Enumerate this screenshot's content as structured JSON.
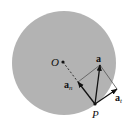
{
  "diagram": {
    "type": "circular-motion-acceleration",
    "circle": {
      "cx": 64,
      "cy": 63,
      "r": 52,
      "fill": "#b3b3b3"
    },
    "points": {
      "O": {
        "x": 63,
        "y": 62,
        "label": "O"
      },
      "P": {
        "x": 95,
        "y": 104,
        "label": "P"
      }
    },
    "vectors": {
      "a": {
        "x2": 100,
        "y2": 65,
        "label": "a"
      },
      "a_n": {
        "x2": 78,
        "y2": 82,
        "label": "a",
        "subscript": "n"
      },
      "a_t": {
        "x2": 117,
        "y2": 89,
        "label": "a",
        "subscript": "t"
      }
    },
    "colors": {
      "stroke": "#111111",
      "construction": "#555555",
      "background": "#ffffff"
    }
  }
}
